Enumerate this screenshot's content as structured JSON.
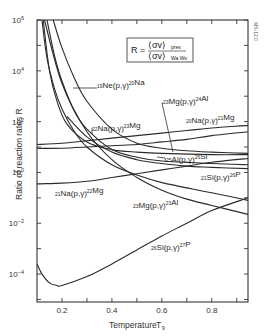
{
  "chart_data": {
    "type": "line",
    "title": "",
    "xlabel": "Temperature T9",
    "ylabel": "Ratio of reaction rates R",
    "xscale": "linear",
    "yscale": "log",
    "xlim": [
      0.1,
      0.945
    ],
    "ylim_log10": [
      -5.1,
      6
    ],
    "xticks": [
      0.2,
      0.4,
      0.6,
      0.8
    ],
    "xtick_labels": [
      "0.2",
      "0.4",
      "0.6",
      "0.8"
    ],
    "yticks_log10": [
      6,
      4,
      2,
      0,
      -2,
      -4
    ],
    "ytick_labels": [
      "10^6",
      "10^4",
      "10^2",
      "10^0",
      "10^-2",
      "10^-4"
    ],
    "grid": false,
    "legend": "none (inline curve labels)",
    "annotation_box": "R = <σv>_pres / <σv>_Wa Wo",
    "figure_id": "MS-12.0",
    "series": [
      {
        "name": "19Ne(p,γ)20Na",
        "x": [
          0.165,
          0.2,
          0.25,
          0.3,
          0.4,
          0.5,
          0.6,
          0.7,
          0.8,
          0.945
        ],
        "log10_y": [
          6.0,
          4.9,
          3.7,
          2.8,
          1.7,
          1.15,
          0.95,
          0.85,
          0.8,
          0.75
        ]
      },
      {
        "name": "22Na(p,γ)23Mg",
        "x": [
          0.14,
          0.17,
          0.2,
          0.25,
          0.3,
          0.4,
          0.5,
          0.6,
          0.8,
          0.945
        ],
        "log10_y": [
          6.0,
          4.6,
          3.6,
          2.4,
          1.7,
          0.9,
          0.6,
          0.45,
          0.35,
          0.3
        ]
      },
      {
        "name": "20Na(p,γ)21Mg",
        "x": [
          0.12,
          0.14,
          0.17,
          0.2,
          0.25,
          0.3,
          0.4,
          0.5,
          0.6,
          0.8,
          0.945
        ],
        "log10_y": [
          6.0,
          4.5,
          3.3,
          2.5,
          1.6,
          1.0,
          0.3,
          -0.1,
          -0.4,
          -0.8,
          -1.1
        ]
      },
      {
        "name": "25Al(p,γ)26Si",
        "x": [
          0.125,
          0.15,
          0.18,
          0.22,
          0.3,
          0.4,
          0.5,
          0.6,
          0.8,
          0.945
        ],
        "log10_y": [
          6.0,
          4.0,
          2.8,
          1.9,
          1.2,
          0.9,
          0.8,
          0.75,
          0.7,
          0.7
        ]
      },
      {
        "name": "23Mg(p,γ)24Al",
        "x": [
          0.1,
          0.2,
          0.3,
          0.4,
          0.5,
          0.6,
          0.7,
          0.8,
          0.945
        ],
        "log10_y": [
          1.1,
          1.15,
          1.25,
          1.35,
          1.45,
          1.55,
          1.65,
          1.75,
          1.85
        ]
      },
      {
        "name": "22Na(p,γ)23Mg (flat)",
        "x": [
          0.1,
          0.2,
          0.3,
          0.4,
          0.5,
          0.6,
          0.7,
          0.8,
          0.945
        ],
        "log10_y": [
          0.95,
          0.95,
          1.0,
          1.05,
          1.1,
          1.2,
          1.3,
          1.45,
          1.6
        ]
      },
      {
        "name": "21Na(p,γ)22Mg",
        "x": [
          0.1,
          0.2,
          0.3,
          0.4,
          0.5,
          0.6,
          0.7,
          0.8,
          0.945
        ],
        "log10_y": [
          -0.45,
          -0.42,
          -0.35,
          -0.2,
          -0.05,
          0.1,
          0.25,
          0.4,
          0.55
        ]
      },
      {
        "name": "21Si(p,γ)26P",
        "x": [
          0.22,
          0.3,
          0.4,
          0.5,
          0.6,
          0.7,
          0.8,
          0.945
        ],
        "log10_y": [
          2.2,
          1.4,
          0.8,
          0.5,
          0.35,
          0.25,
          0.2,
          0.15
        ]
      },
      {
        "name": "23Mg(p,γ)23Al",
        "x": [
          0.13,
          0.2,
          0.3,
          0.4,
          0.5,
          0.6,
          0.7,
          0.8,
          0.945
        ],
        "log10_y": [
          6.0,
          3.5,
          1.6,
          0.5,
          -0.2,
          -0.7,
          -1.05,
          -1.3,
          -1.65
        ]
      },
      {
        "name": "26Si(p,γ)27P",
        "x": [
          0.1,
          0.12,
          0.15,
          0.18,
          0.2,
          0.3,
          0.4,
          0.5,
          0.6,
          0.7,
          0.8,
          0.945
        ],
        "log10_y": [
          -3.6,
          -4.0,
          -4.35,
          -4.45,
          -4.45,
          -4.1,
          -3.6,
          -3.05,
          -2.5,
          -2.0,
          -1.5,
          -1.0
        ]
      }
    ]
  },
  "labels": {
    "ylabel": "Ratio of reaction rates R",
    "xlabel": "Temperature",
    "xlabel_sub": "T",
    "xlabel_subscript": "9",
    "formula_R": "R =",
    "formula_num": "⟨σv⟩",
    "formula_num_sub": "pres",
    "formula_den": "⟨σv⟩",
    "formula_den_sub": "Wa Wo",
    "figure_id": "MS-12.0",
    "curve_labels": [
      {
        "text": "19Ne(p,γ)20Na",
        "x": 97,
        "y": 91
      },
      {
        "text": "22Na(p,γ)23Mg",
        "x": 92,
        "y": 134
      },
      {
        "text": "23Mg(p,γ)24Al",
        "x": 163,
        "y": 107
      },
      {
        "text": "20Na(p,γ)21Mg",
        "x": 186,
        "y": 126
      },
      {
        "text": "25Al(p,γ)26Si",
        "x": 166,
        "y": 165
      },
      {
        "text": "21Si(p,γ)26P",
        "x": 201,
        "y": 183
      },
      {
        "text": "21Na(p,γ)22Mg",
        "x": 55,
        "y": 199
      },
      {
        "text": "23Mg(p,γ)23Al",
        "x": 133,
        "y": 211
      },
      {
        "text": "26Si(p,γ)27P",
        "x": 151,
        "y": 253
      }
    ]
  }
}
